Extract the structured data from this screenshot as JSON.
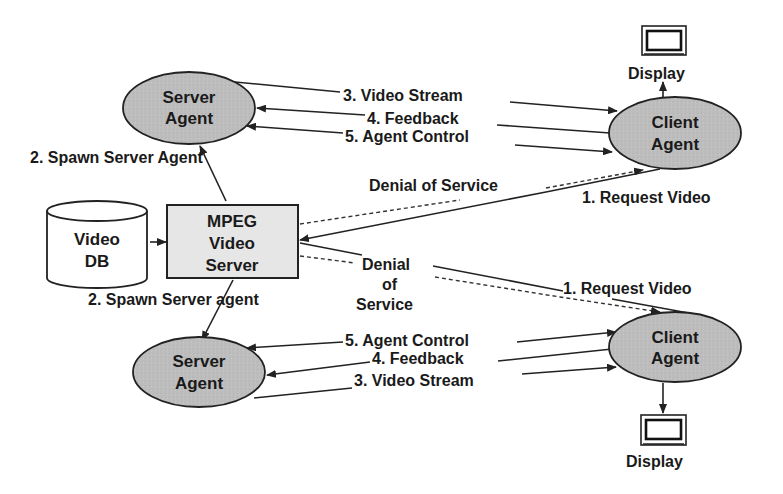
{
  "colors": {
    "ellipse_fill": "#bdbdbd",
    "box_fill": "#e6e6e6",
    "stroke": "#222222",
    "background": "#ffffff"
  },
  "nodes": {
    "server_agent_top": {
      "line1": "Server",
      "line2": "Agent"
    },
    "client_agent_top": {
      "line1": "Client",
      "line2": "Agent"
    },
    "display_top": {
      "label": "Display",
      "icon": "monitor-icon"
    },
    "video_db": {
      "line1": "Video",
      "line2": "DB",
      "icon": "database-cylinder"
    },
    "mpeg_server": {
      "line1": "MPEG",
      "line2": "Video",
      "line3": "Server"
    },
    "server_agent_bottom": {
      "line1": "Server",
      "line2": "Agent"
    },
    "client_agent_bottom": {
      "line1": "Client",
      "line2": "Agent"
    },
    "display_bottom": {
      "label": "Display",
      "icon": "monitor-icon"
    }
  },
  "edges": {
    "top": {
      "video_stream": "3. Video Stream",
      "feedback": "4. Feedback",
      "agent_control": "5. Agent Control",
      "spawn": "2. Spawn Server Agent",
      "denial": "Denial of Service",
      "request": "1. Request Video"
    },
    "bottom": {
      "video_stream": "3. Video Stream",
      "feedback": "4. Feedback",
      "agent_control": "5. Agent Control",
      "spawn": "2. Spawn Server agent",
      "denial_line1": "Denial",
      "denial_line2": "of",
      "denial_line3": "Service",
      "request": "1. Request Video"
    }
  }
}
